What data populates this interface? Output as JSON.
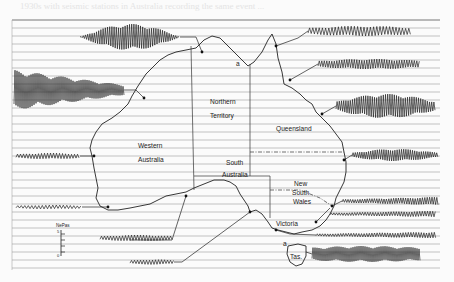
{
  "page": {
    "bleed_through_text": "1930s with seismic stations in Australia recording the same event ...",
    "figure_type": "map of seismograph stations with recorded seismograms"
  },
  "map": {
    "regions": [
      {
        "id": "nt",
        "line1": "Northern",
        "line2": "Territory"
      },
      {
        "id": "qld",
        "line1": "Queensland",
        "line2": ""
      },
      {
        "id": "wa",
        "line1": "Western",
        "line2": "Australia"
      },
      {
        "id": "sa",
        "line1": "South",
        "line2": "Australia"
      },
      {
        "id": "nsw",
        "line1": "New",
        "line2": "South",
        "line3": "Wales"
      },
      {
        "id": "vic",
        "line1": "Victoria",
        "line2": ""
      },
      {
        "id": "tas",
        "line1": "Tas.",
        "line2": ""
      }
    ],
    "scale_bar": {
      "label": "NePas",
      "ticks": [
        "5",
        "",
        "",
        "",
        "0"
      ]
    },
    "markers": {
      "north_letter": "a",
      "tas_letter": "a"
    }
  },
  "seismograms": [
    {
      "name": "north-central",
      "amplitude": "large"
    },
    {
      "name": "northwest",
      "amplitude": "large"
    },
    {
      "name": "west-coast",
      "amplitude": "small"
    },
    {
      "name": "southwest",
      "amplitude": "small"
    },
    {
      "name": "south-central-1",
      "amplitude": "small"
    },
    {
      "name": "south-central-2",
      "amplitude": "small"
    },
    {
      "name": "northeast-1",
      "amplitude": "medium"
    },
    {
      "name": "northeast-2",
      "amplitude": "medium"
    },
    {
      "name": "queensland-coast",
      "amplitude": "large"
    },
    {
      "name": "east-1",
      "amplitude": "medium"
    },
    {
      "name": "east-2",
      "amplitude": "medium"
    },
    {
      "name": "nsw-coast",
      "amplitude": "small"
    },
    {
      "name": "victoria",
      "amplitude": "small"
    },
    {
      "name": "tasmania",
      "amplitude": "large"
    }
  ]
}
